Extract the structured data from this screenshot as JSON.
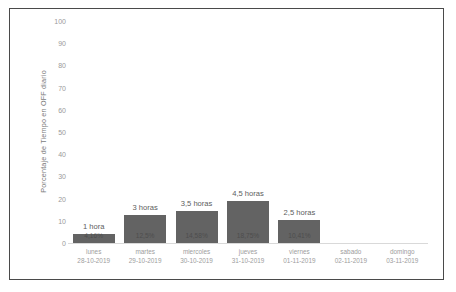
{
  "chart_data": {
    "type": "bar",
    "title": "",
    "subtitle": "",
    "xlabel": "",
    "ylabel": "Porcentaje de Tiempo en OFF diario",
    "ylim": [
      0,
      100
    ],
    "yticks": [
      100,
      90,
      80,
      70,
      60,
      50,
      40,
      30,
      20,
      10,
      0
    ],
    "grid": false,
    "legend": null,
    "bar_color": "#636363",
    "categories": [
      "lunes 28-10-2019",
      "martes 29-10-2019",
      "miercoles 30-10-2019",
      "jueves 31-10-2019",
      "viernes 01-11-2019",
      "sabado 02-11-2019",
      "domingo 03-11-2019"
    ],
    "values": [
      4.16,
      12.5,
      14.58,
      18.75,
      10.41,
      0,
      0
    ],
    "annotations_above": [
      "1 hora",
      "3 horas",
      "3,5 horas",
      "4,5 horas",
      "2,5 horas",
      "",
      ""
    ],
    "annotations_inside": [
      "4,16%",
      "12,5%",
      "14,58%",
      "18,75%",
      "10,41%",
      "",
      ""
    ]
  },
  "axis": {
    "y_title": "Porcentaje de Tiempo en OFF diario",
    "y_ticks": [
      "100",
      "90",
      "80",
      "70",
      "60",
      "50",
      "40",
      "30",
      "20",
      "10",
      "0"
    ],
    "x_categories": [
      {
        "day": "lunes",
        "date": "28-10-2019"
      },
      {
        "day": "martes",
        "date": "29-10-2019"
      },
      {
        "day": "miercoles",
        "date": "30-10-2019"
      },
      {
        "day": "jueves",
        "date": "31-10-2019"
      },
      {
        "day": "viernes",
        "date": "01-11-2019"
      },
      {
        "day": "sabado",
        "date": "02-11-2019"
      },
      {
        "day": "domingo",
        "date": "03-11-2019"
      }
    ]
  },
  "bars": [
    {
      "top_label": "1 hora",
      "inner_label": "4,16%",
      "value": 4.16
    },
    {
      "top_label": "3 horas",
      "inner_label": "12,5%",
      "value": 12.5
    },
    {
      "top_label": "3,5 horas",
      "inner_label": "14,58%",
      "value": 14.58
    },
    {
      "top_label": "4,5 horas",
      "inner_label": "18,75%",
      "value": 18.75
    },
    {
      "top_label": "2,5 horas",
      "inner_label": "10,41%",
      "value": 10.41
    },
    {
      "top_label": "",
      "inner_label": "",
      "value": 0
    },
    {
      "top_label": "",
      "inner_label": "",
      "value": 0
    }
  ],
  "colors": {
    "bar": "#636363",
    "frame": "#4a4a4a",
    "tick_text": "#9a9a9a",
    "label_text": "#5d5d5d",
    "background": "#ffffff"
  }
}
